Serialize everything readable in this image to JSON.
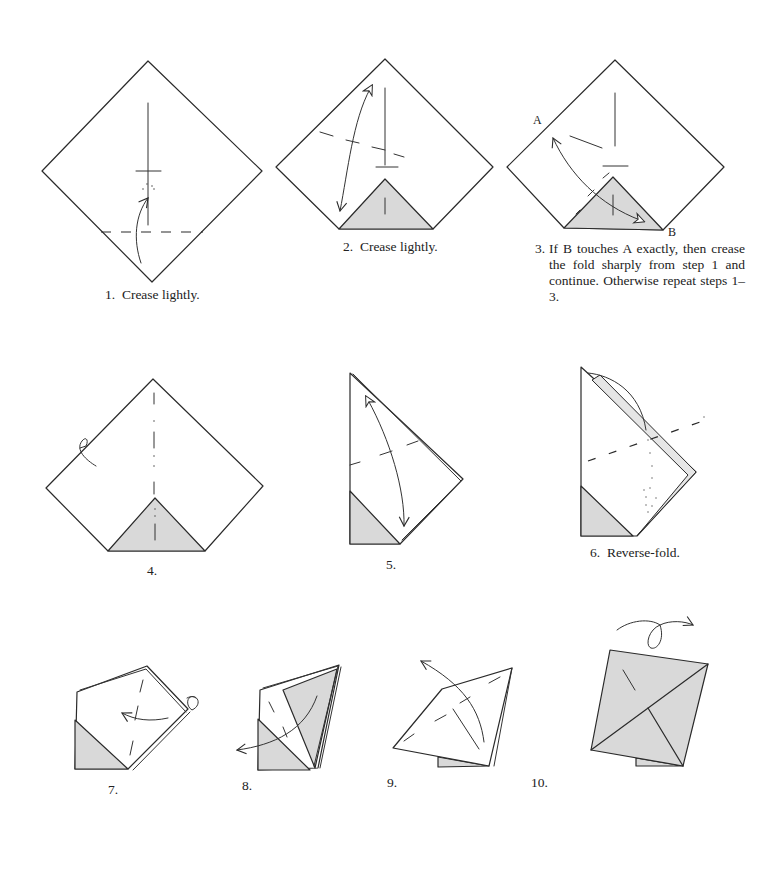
{
  "page": {
    "type": "origami instruction diagrams",
    "colors": {
      "line": "#2a2a2a",
      "shaded_paper": "#d9d9d9",
      "background": "#ffffff"
    }
  },
  "steps": [
    {
      "number": "1.",
      "caption": "Crease lightly."
    },
    {
      "number": "2.",
      "caption": "Crease lightly."
    },
    {
      "number": "3.",
      "caption": "If B touches A exactly, then crease the fold sharply from step 1 and continue. Otherwise repeat steps 1–3.",
      "point_labels": [
        "A",
        "B"
      ]
    },
    {
      "number": "4.",
      "caption": ""
    },
    {
      "number": "5.",
      "caption": ""
    },
    {
      "number": "6.",
      "caption": "Reverse-fold."
    },
    {
      "number": "7.",
      "caption": ""
    },
    {
      "number": "8.",
      "caption": ""
    },
    {
      "number": "9.",
      "caption": ""
    },
    {
      "number": "10.",
      "caption": ""
    }
  ]
}
